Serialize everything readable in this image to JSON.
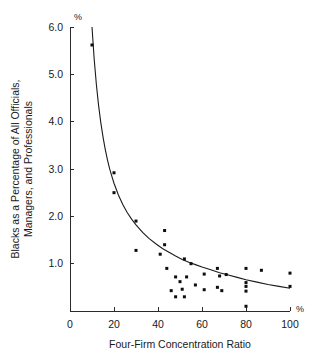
{
  "chart_data": {
    "type": "scatter",
    "title": "",
    "xlabel": "Four-Firm Concentration Ratio",
    "ylabel": "Blacks as a Percentage of All Officials, Managers, and Professionals",
    "ylabel_line1": "Blacks as a Percentage of All Officials,",
    "ylabel_line2": "Managers, and Professionals",
    "x_unit_label": "%",
    "y_unit_label": "%",
    "xlim": [
      0,
      100
    ],
    "ylim": [
      0,
      6.0
    ],
    "xticks": [
      0,
      20,
      40,
      60,
      80,
      100
    ],
    "xticklabels": [
      "0",
      "20",
      "40",
      "60",
      "80",
      "100"
    ],
    "yticks": [
      1.0,
      2.0,
      3.0,
      4.0,
      5.0,
      6.0
    ],
    "yticklabels": [
      "1.0",
      "2.0",
      "3.0",
      "4.0",
      "5.0",
      "6.0"
    ],
    "grid": false,
    "legend": false,
    "marker": "square",
    "marker_color": "#0d0d0d",
    "curve_color": "#1b1b1b",
    "axis_color": "#2b2b2b",
    "background": "#ffffff",
    "points": [
      {
        "x": 10,
        "y": 5.62
      },
      {
        "x": 20,
        "y": 2.92
      },
      {
        "x": 20,
        "y": 2.5
      },
      {
        "x": 30,
        "y": 1.9
      },
      {
        "x": 30,
        "y": 1.28
      },
      {
        "x": 41,
        "y": 1.2
      },
      {
        "x": 43,
        "y": 1.7
      },
      {
        "x": 43,
        "y": 1.4
      },
      {
        "x": 44,
        "y": 0.9
      },
      {
        "x": 46,
        "y": 0.43
      },
      {
        "x": 48,
        "y": 0.72
      },
      {
        "x": 48,
        "y": 0.3
      },
      {
        "x": 50,
        "y": 0.62
      },
      {
        "x": 51,
        "y": 0.46
      },
      {
        "x": 52,
        "y": 1.1
      },
      {
        "x": 52,
        "y": 0.3
      },
      {
        "x": 53,
        "y": 0.72
      },
      {
        "x": 55,
        "y": 1.0
      },
      {
        "x": 57,
        "y": 0.55
      },
      {
        "x": 61,
        "y": 0.45
      },
      {
        "x": 61,
        "y": 0.78
      },
      {
        "x": 67,
        "y": 0.9
      },
      {
        "x": 67,
        "y": 0.5
      },
      {
        "x": 68,
        "y": 0.74
      },
      {
        "x": 69,
        "y": 0.43
      },
      {
        "x": 71,
        "y": 0.77
      },
      {
        "x": 80,
        "y": 0.9
      },
      {
        "x": 80,
        "y": 0.6
      },
      {
        "x": 80,
        "y": 0.52
      },
      {
        "x": 80,
        "y": 0.42
      },
      {
        "x": 80,
        "y": 0.1
      },
      {
        "x": 87,
        "y": 0.86
      },
      {
        "x": 100,
        "y": 0.8
      },
      {
        "x": 100,
        "y": 0.52
      }
    ],
    "fit_curve": {
      "description": "decaying power/hyperbolic fit",
      "points": [
        {
          "x": 10.0,
          "y": 6.0
        },
        {
          "x": 11.0,
          "y": 5.32
        },
        {
          "x": 12.0,
          "y": 4.78
        },
        {
          "x": 13.0,
          "y": 4.34
        },
        {
          "x": 14.0,
          "y": 3.98
        },
        {
          "x": 15.0,
          "y": 3.68
        },
        {
          "x": 16.0,
          "y": 3.42
        },
        {
          "x": 17.0,
          "y": 3.2
        },
        {
          "x": 18.0,
          "y": 3.01
        },
        {
          "x": 19.0,
          "y": 2.85
        },
        {
          "x": 20.0,
          "y": 2.7
        },
        {
          "x": 22.0,
          "y": 2.45
        },
        {
          "x": 24.0,
          "y": 2.25
        },
        {
          "x": 26.0,
          "y": 2.08
        },
        {
          "x": 28.0,
          "y": 1.94
        },
        {
          "x": 30.0,
          "y": 1.82
        },
        {
          "x": 33.0,
          "y": 1.66
        },
        {
          "x": 36.0,
          "y": 1.53
        },
        {
          "x": 39.0,
          "y": 1.42
        },
        {
          "x": 42.0,
          "y": 1.32
        },
        {
          "x": 45.0,
          "y": 1.24
        },
        {
          "x": 48.0,
          "y": 1.16
        },
        {
          "x": 51.0,
          "y": 1.09
        },
        {
          "x": 54.0,
          "y": 1.03
        },
        {
          "x": 57.0,
          "y": 0.98
        },
        {
          "x": 60.0,
          "y": 0.93
        },
        {
          "x": 64.0,
          "y": 0.87
        },
        {
          "x": 68.0,
          "y": 0.81
        },
        {
          "x": 72.0,
          "y": 0.76
        },
        {
          "x": 76.0,
          "y": 0.71
        },
        {
          "x": 80.0,
          "y": 0.66
        },
        {
          "x": 85.0,
          "y": 0.61
        },
        {
          "x": 90.0,
          "y": 0.56
        },
        {
          "x": 95.0,
          "y": 0.52
        },
        {
          "x": 100.0,
          "y": 0.48
        }
      ]
    }
  }
}
